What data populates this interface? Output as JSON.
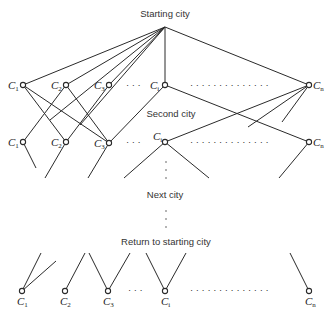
{
  "diagram": {
    "labels": {
      "start": "Starting city",
      "second": "Second city",
      "next": "Next city",
      "return": "Return to starting city"
    },
    "node_prefix": "C",
    "city_subscripts": [
      "1",
      "2",
      "3",
      "i",
      "n"
    ],
    "rows": [
      {
        "name": "level-1",
        "y": 85
      },
      {
        "name": "level-2",
        "y": 142
      },
      {
        "name": "return-level",
        "y": 291
      }
    ],
    "separators": {
      "short": "· · ·",
      "long": "· · · · · · · · · · · · · ·",
      "vertical": "⋮"
    }
  }
}
